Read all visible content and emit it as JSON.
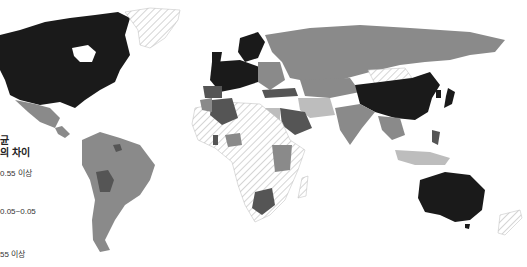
{
  "map": {
    "type": "choropleth world map",
    "colors": {
      "dark": "#1a1a1a",
      "mid_dark": "#555555",
      "mid": "#8a8a8a",
      "light": "#bdbdbd",
      "hatched": "#e6e6e6",
      "background": "#ffffff"
    },
    "legend": {
      "title_line1": "균",
      "title_line2": "의 차이",
      "items": [
        {
          "label": "0.55 이상",
          "color": "#1a1a1a"
        },
        {
          "label": "0.05~0.05",
          "color": "#8a8a8a"
        },
        {
          "label": "55 이상",
          "color": "#bdbdbd"
        }
      ]
    }
  }
}
